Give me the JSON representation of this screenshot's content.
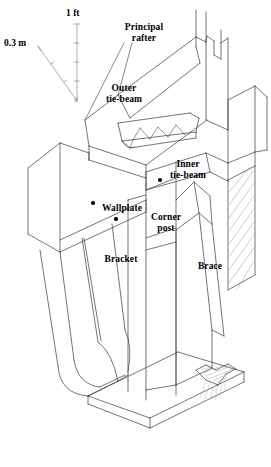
{
  "figure": {
    "background_color": "#ffffff",
    "line_color": "#333333",
    "text_color": "#000000",
    "width": 271,
    "height": 467
  },
  "scales": [
    {
      "id": "metric",
      "label": "0.3 m",
      "orientation": "diagonal",
      "tick_count": 2
    },
    {
      "id": "imperial",
      "label": "1 ft",
      "orientation": "vertical",
      "tick_count": 4,
      "zero_label": "0"
    }
  ],
  "labels": [
    {
      "id": "principal-rafter",
      "text": "Principal\nrafter"
    },
    {
      "id": "outer-tie-beam",
      "text": "Outer\ntie-beam"
    },
    {
      "id": "inner-tie-beam",
      "text": "Inner\ntie-beam"
    },
    {
      "id": "wallplate",
      "text": "Wallplate"
    },
    {
      "id": "corner-post",
      "text": "Corner\npost"
    },
    {
      "id": "bracket",
      "text": "Bracket"
    },
    {
      "id": "brace",
      "text": "Brace"
    }
  ]
}
